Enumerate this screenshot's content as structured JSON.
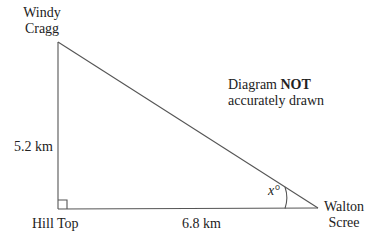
{
  "diagram": {
    "vertices": {
      "top": {
        "name_line1": "Windy",
        "name_line2": "Cragg"
      },
      "right_angle": {
        "name": "Hill Top"
      },
      "right": {
        "name_line1": "Walton",
        "name_line2": "Scree"
      }
    },
    "sides": {
      "vertical": {
        "label": "5.2 km"
      },
      "horizontal": {
        "label": "6.8 km"
      }
    },
    "angle": {
      "label": "x°"
    },
    "note": {
      "prefix": "Diagram ",
      "bold": "NOT",
      "line2": "accurately drawn"
    },
    "colors": {
      "line": "#555555",
      "text": "#222222"
    }
  }
}
